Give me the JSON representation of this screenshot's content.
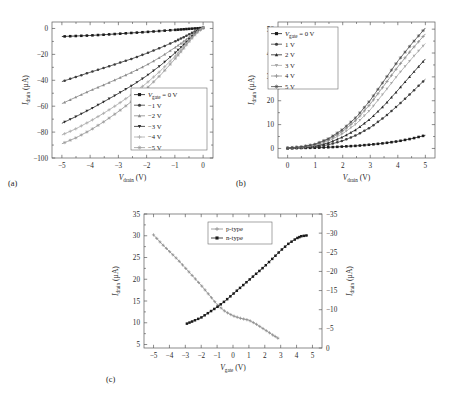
{
  "figure": {
    "panel_labels": {
      "a": "(a)",
      "b": "(b)",
      "c": "(c)"
    }
  },
  "axis_titles": {
    "i_drain": {
      "main": "I",
      "sub": "drain",
      "unit": "(µA)"
    },
    "v_drain": {
      "main": "V",
      "sub": "drain",
      "unit": "(V)"
    },
    "v_gate": {
      "main": "V",
      "sub": "gate",
      "unit": "(V)"
    }
  },
  "legend_labels": {
    "vgate_prefix": {
      "main": "V",
      "sub": "gate"
    },
    "p_type": "p-type",
    "n_type": "n-type"
  },
  "colors": {
    "black": "#1a1a1a",
    "dark_gray": "#3d3d3d",
    "mid_gray": "#6e6e6e",
    "gray": "#8a8a8a",
    "light_gray": "#a8a8a8",
    "lighter_gray": "#9a9a9a",
    "frame": "#5a5a5a"
  },
  "chart_data": [
    {
      "id": "panel-a",
      "type": "line",
      "title": "",
      "xlabel": "V_drain (V)",
      "ylabel": "I_drain (µA)",
      "xlim": [
        -5.35,
        0.35
      ],
      "ylim": [
        -100,
        5
      ],
      "xticks": [
        -5,
        -4,
        -3,
        -2,
        -1,
        0
      ],
      "xticklabels": [
        "−5",
        "−4",
        "−3",
        "−2",
        "−1",
        "0"
      ],
      "yticks": [
        0,
        -20,
        -40,
        -60,
        -80,
        -100
      ],
      "yticklabels": [
        "0",
        "−20",
        "−40",
        "−60",
        "−80",
        "−100"
      ],
      "grid": false,
      "legend_position": "lower-right",
      "legend_entries": [
        "V_gate = 0 V",
        "−1 V",
        "−2 V",
        "−3 V",
        "−4 V",
        "−5 V"
      ],
      "x": [
        0,
        -0.25,
        -0.5,
        -0.75,
        -1,
        -1.5,
        -2,
        -2.5,
        -3,
        -3.5,
        -4,
        -4.5,
        -5
      ],
      "series": [
        {
          "name": "V_gate = 0 V",
          "marker": "square-filled",
          "color": "#1a1a1a",
          "values": [
            0.4,
            0.1,
            -0.3,
            -0.7,
            -1.1,
            -1.9,
            -2.7,
            -3.4,
            -4.1,
            -4.8,
            -5.4,
            -5.8,
            -6.2
          ]
        },
        {
          "name": "−1 V",
          "marker": "circle-filled",
          "color": "#3d3d3d",
          "values": [
            0.5,
            -1.8,
            -4.6,
            -7.4,
            -10.0,
            -14.8,
            -19.2,
            -23.2,
            -26.8,
            -30.4,
            -33.8,
            -37.4,
            -41.0
          ]
        },
        {
          "name": "−2 V",
          "marker": "triangle-up",
          "color": "#8a8a8a",
          "values": [
            0.6,
            -2.6,
            -6.8,
            -11.0,
            -14.8,
            -22.0,
            -28.2,
            -33.6,
            -38.6,
            -43.4,
            -48.0,
            -53.0,
            -58.0
          ]
        },
        {
          "name": "−3 V",
          "marker": "triangle-down",
          "color": "#2b2b2b",
          "values": [
            0.6,
            -3.2,
            -8.4,
            -13.8,
            -19.0,
            -28.4,
            -36.6,
            -43.8,
            -50.2,
            -56.4,
            -62.4,
            -68.0,
            -73.2
          ]
        },
        {
          "name": "−4 V",
          "marker": "plus",
          "color": "#a8a8a8",
          "values": [
            0.7,
            -3.6,
            -9.4,
            -15.6,
            -21.6,
            -32.6,
            -42.2,
            -50.6,
            -58.2,
            -65.2,
            -71.6,
            -77.4,
            -82.2
          ]
        },
        {
          "name": "−5 V",
          "marker": "star",
          "color": "#9a9a9a",
          "values": [
            0.8,
            -3.9,
            -10.2,
            -17.0,
            -23.6,
            -35.8,
            -46.4,
            -55.8,
            -64.2,
            -71.8,
            -78.6,
            -84.4,
            -89.0
          ]
        }
      ]
    },
    {
      "id": "panel-b",
      "type": "line",
      "title": "",
      "xlabel": "V_drain (V)",
      "ylabel": "I_drain (µA)",
      "xlim": [
        -0.35,
        5.35
      ],
      "ylim": [
        -4,
        53
      ],
      "xticks": [
        0,
        1,
        2,
        3,
        4,
        5
      ],
      "xticklabels": [
        "0",
        "1",
        "2",
        "3",
        "4",
        "5"
      ],
      "yticks": [
        0,
        10,
        20,
        30,
        40,
        50
      ],
      "yticklabels": [
        "0",
        "10",
        "20",
        "30",
        "40",
        "50"
      ],
      "grid": false,
      "legend_position": "upper-left",
      "legend_entries": [
        "V_gate = 0 V",
        "1 V",
        "2 V",
        "3 V",
        "4 V",
        "5 V"
      ],
      "x": [
        0,
        0.5,
        1,
        1.5,
        2,
        2.5,
        3,
        3.5,
        4,
        4.5,
        5
      ],
      "series": [
        {
          "name": "V_gate = 0 V",
          "marker": "square-filled",
          "color": "#1a1a1a",
          "values": [
            0.1,
            0.2,
            0.3,
            0.5,
            0.8,
            1.1,
            1.6,
            2.2,
            3.0,
            4.1,
            5.5
          ]
        },
        {
          "name": "1 V",
          "marker": "circle-filled",
          "color": "#3d3d3d",
          "values": [
            0.1,
            0.3,
            0.7,
            1.6,
            3.2,
            5.6,
            8.8,
            13.0,
            18.0,
            23.4,
            29.0
          ]
        },
        {
          "name": "2 V",
          "marker": "triangle-up",
          "color": "#2b2b2b",
          "values": [
            0.1,
            0.4,
            1.0,
            2.4,
            4.8,
            8.0,
            12.4,
            18.0,
            24.4,
            31.0,
            37.5
          ]
        },
        {
          "name": "3 V",
          "marker": "triangle-down",
          "color": "#a8a8a8",
          "values": [
            0.2,
            0.5,
            1.3,
            3.2,
            6.2,
            10.4,
            16.2,
            23.4,
            30.8,
            37.6,
            44.0
          ]
        },
        {
          "name": "4 V",
          "marker": "plus",
          "color": "#8a8a8a",
          "values": [
            0.2,
            0.6,
            1.6,
            3.8,
            7.2,
            12.0,
            18.6,
            26.4,
            34.2,
            41.4,
            48.0
          ]
        },
        {
          "name": "5 V",
          "marker": "star",
          "color": "#4a4a4a",
          "values": [
            0.2,
            0.7,
            1.8,
            4.2,
            8.0,
            13.2,
            20.2,
            28.4,
            36.6,
            43.8,
            50.5
          ]
        }
      ]
    },
    {
      "id": "panel-c",
      "type": "line",
      "title": "",
      "xlabel": "V_gate (V)",
      "ylabel_left": "I_drain (µA)",
      "ylabel_right": "I_drain (µA)",
      "xlim": [
        -5.6,
        5.6
      ],
      "ylim_left": [
        4.2,
        35
      ],
      "ylim_right": [
        0,
        -35
      ],
      "xticks": [
        -5,
        -4,
        -3,
        -2,
        -1,
        0,
        1,
        2,
        3,
        4,
        5
      ],
      "xticklabels": [
        "−5",
        "−4",
        "−3",
        "−2",
        "−1",
        "0",
        "1",
        "2",
        "3",
        "4",
        "5"
      ],
      "yticks_left": [
        5,
        10,
        15,
        20,
        25,
        30,
        35
      ],
      "yticklabels_left": [
        "5",
        "10",
        "15",
        "20",
        "25",
        "30",
        "35"
      ],
      "yticks_right": [
        0,
        -5,
        -10,
        -15,
        -20,
        -25,
        -30,
        -35
      ],
      "yticklabels_right": [
        "0",
        "−5",
        "−10",
        "−15",
        "−20",
        "−25",
        "−30",
        "−35"
      ],
      "grid": false,
      "legend_position": "upper-center",
      "legend_entries": [
        "p-type",
        "n-type"
      ],
      "series": [
        {
          "name": "p-type",
          "marker": "plus",
          "color": "#8a8a8a",
          "axis": "left",
          "x": [
            -5.0,
            -4.5,
            -4.0,
            -3.5,
            -3.0,
            -2.5,
            -2.0,
            -1.5,
            -1.0,
            -0.5,
            0.0,
            0.5,
            1.0,
            1.5,
            2.0,
            2.5,
            2.9
          ],
          "values": [
            30.2,
            28.2,
            26.4,
            24.6,
            22.6,
            20.6,
            18.6,
            16.4,
            14.2,
            12.6,
            11.6,
            11.0,
            10.6,
            9.6,
            8.4,
            7.2,
            6.3
          ]
        },
        {
          "name": "n-type",
          "marker": "square-filled",
          "color": "#1a1a1a",
          "axis": "left",
          "x": [
            -2.9,
            -2.5,
            -2.0,
            -1.5,
            -1.0,
            -0.5,
            0.0,
            0.5,
            1.0,
            1.5,
            2.0,
            2.5,
            3.0,
            3.5,
            4.0,
            4.3,
            4.7
          ],
          "values": [
            9.8,
            10.4,
            11.2,
            12.4,
            13.6,
            15.0,
            16.6,
            18.2,
            19.8,
            21.4,
            23.0,
            24.8,
            26.6,
            28.2,
            29.4,
            29.9,
            30.1
          ]
        }
      ]
    }
  ]
}
